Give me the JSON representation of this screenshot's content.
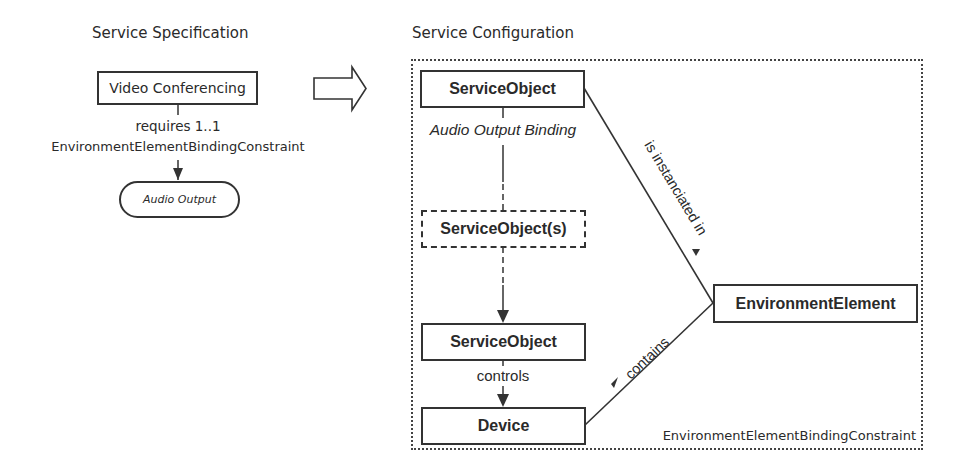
{
  "specification": {
    "title": "Service Specification",
    "service_box": "Video Conferencing",
    "relation_line1": "requires 1..1",
    "relation_line2": "EnvironmentElementBindingConstraint",
    "target": "Audio Output"
  },
  "transform_arrow": {
    "icon": "block-arrow-right-icon"
  },
  "configuration": {
    "title": "Service Configuration",
    "container_label": "EnvironmentElementBindingConstraint",
    "nodes": {
      "service_object_top": "ServiceObject",
      "service_objects_intermediate": "ServiceObject(s)",
      "service_object_bottom": "ServiceObject",
      "device": "Device",
      "environment_element": "EnvironmentElement"
    },
    "edges": {
      "binding_label": "Audio Output Binding",
      "controls_label": "controls",
      "instanciated_label": "is instanciated in",
      "contains_label": "contains"
    },
    "colors": {
      "stroke": "#333333",
      "text": "#2a2a2a",
      "background": "#ffffff"
    }
  }
}
